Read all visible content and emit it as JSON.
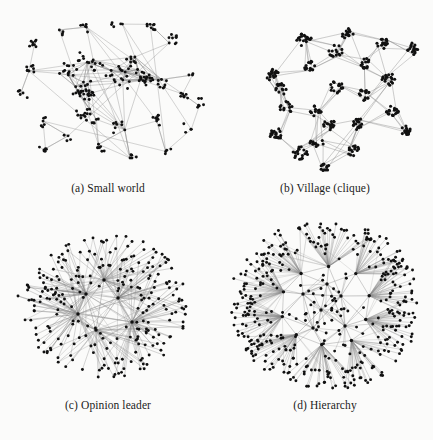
{
  "figure": {
    "background_color": "#fbfbfa",
    "node_color": "#111111",
    "edge_color": "#8c8c8c",
    "caption_color": "#1b1b1b",
    "panel_count": 4,
    "layout": "2x2 grid"
  },
  "panels": [
    {
      "key": "a",
      "caption": "(a) Small world",
      "network_type": "small-world",
      "description": "Sparse small-world graph with many small peripheral clusters linked by long-range shortcut edges into a denser center"
    },
    {
      "key": "b",
      "caption": "(b) Village (clique)",
      "network_type": "village-clique",
      "description": "Many dense cliques (villages) of tightly packed nodes connected to each other by sparse inter-clique edges"
    },
    {
      "key": "c",
      "caption": "(c) Opinion leader",
      "network_type": "opinion-leader",
      "description": "Several high-degree hub nodes (opinion leaders) radiating dense spokes to many peripheral nodes"
    },
    {
      "key": "d",
      "caption": "(d) Hierarchy",
      "network_type": "hierarchy",
      "description": "Hierarchical network with a central core of hubs branching outward into large fan-shaped leaf sets"
    }
  ],
  "chart_data": {
    "type": "scatter",
    "title": "",
    "xlabel": "",
    "ylabel": "",
    "series": [
      {
        "name": "(a) Small world",
        "approx_node_count": 300,
        "approx_edge_count": 330,
        "topology": "small-world",
        "hub_count": 0,
        "cluster_count": 26
      },
      {
        "name": "(b) Village (clique)",
        "approx_node_count": 330,
        "approx_edge_count": 60,
        "topology": "clique-of-cliques",
        "hub_count": 0,
        "cluster_count": 22
      },
      {
        "name": "(c) Opinion leader",
        "approx_node_count": 300,
        "approx_edge_count": 320,
        "topology": "star-hub",
        "hub_count": 5,
        "cluster_count": 1
      },
      {
        "name": "(d) Hierarchy",
        "approx_node_count": 420,
        "approx_edge_count": 440,
        "topology": "hierarchical-tree",
        "hub_count": 9,
        "cluster_count": 9
      }
    ]
  }
}
